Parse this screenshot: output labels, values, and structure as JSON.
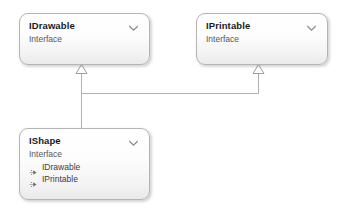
{
  "diagram": {
    "type": "uml-class-diagram",
    "background_color": "#ffffff",
    "box_border_color": "#b4b4b4",
    "box_fill_top_color": "#ffffff",
    "box_fill_bottom_color": "#eaeaea",
    "connector_color": "#b0b0b0",
    "title_color": "#1a1a1a",
    "stereotype_color": "#585858",
    "member_color": "#3c3c3c",
    "icon_color": "#7a7a7a"
  },
  "classes": [
    {
      "id": "idrawable",
      "name": "IDrawable",
      "stereotype": "Interface",
      "collapse_icon": "double-chevron-down-icon",
      "members": []
    },
    {
      "id": "iprintable",
      "name": "IPrintable",
      "stereotype": "Interface",
      "collapse_icon": "double-chevron-down-icon",
      "members": []
    },
    {
      "id": "ishape",
      "name": "IShape",
      "stereotype": "Interface",
      "collapse_icon": "double-chevron-down-icon",
      "members": [
        {
          "icon": "implements-interface-icon",
          "label": "IDrawable"
        },
        {
          "icon": "implements-interface-icon",
          "label": "IPrintable"
        }
      ]
    }
  ],
  "relationships": [
    {
      "id": "ishape-to-idrawable",
      "type": "realization",
      "from": "IShape",
      "to": "IDrawable",
      "arrowhead": "hollow-triangle"
    },
    {
      "id": "ishape-to-iprintable",
      "type": "realization",
      "from": "IShape",
      "to": "IPrintable",
      "arrowhead": "hollow-triangle"
    }
  ]
}
